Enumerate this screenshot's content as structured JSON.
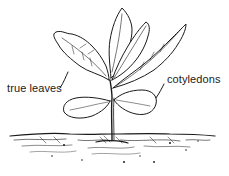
{
  "diagram": {
    "labels": [
      {
        "id": "true-leaves",
        "text": "true leaves"
      },
      {
        "id": "cotyledons",
        "text": "cotyledons"
      }
    ],
    "colors": {
      "ink": "#1a1a1a",
      "background": "#ffffff"
    }
  }
}
